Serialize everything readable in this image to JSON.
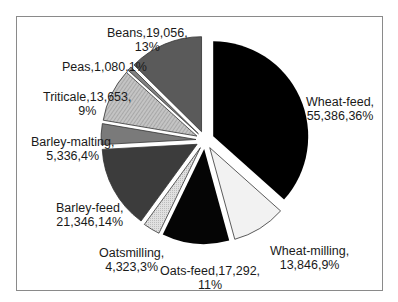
{
  "chart_data": {
    "type": "pie",
    "title": "",
    "start_angle_deg": 0,
    "direction": "clockwise",
    "exploded": true,
    "slices": [
      {
        "label": "Wheat-feed",
        "value": 55386,
        "percent": 36,
        "text_line1": "Wheat-feed,",
        "text_line2": "55,386,36%",
        "fill": "#000000",
        "pattern": "solid"
      },
      {
        "label": "Wheat-milling",
        "value": 13846,
        "percent": 9,
        "text_line1": "Wheat-milling,",
        "text_line2": "13,846,9%",
        "fill": "#f2f2f2",
        "pattern": "solid"
      },
      {
        "label": "Oats-feed",
        "value": 17292,
        "percent": 11,
        "text_line1": "Oats-feed,17,292,",
        "text_line2": "11%",
        "fill": "#050505",
        "pattern": "solid"
      },
      {
        "label": "Oatsmilling",
        "value": 4323,
        "percent": 3,
        "text_line1": "Oatsmilling,",
        "text_line2": "4,323,3%",
        "fill": "#d6d6d6",
        "pattern": "dots"
      },
      {
        "label": "Barley-feed",
        "value": 21346,
        "percent": 14,
        "text_line1": "Barley-feed,",
        "text_line2": "21,346,14%",
        "fill": "#3c3c3c",
        "pattern": "solid"
      },
      {
        "label": "Barley-malting",
        "value": 5336,
        "percent": 4,
        "text_line1": "Barley-malting,",
        "text_line2": "5,336,4%",
        "fill": "#7a7a7a",
        "pattern": "solid"
      },
      {
        "label": "Triticale",
        "value": 13653,
        "percent": 9,
        "text_line1": "Triticale,13,653,",
        "text_line2": "9%",
        "fill": "#b4b4b4",
        "pattern": "hatch"
      },
      {
        "label": "Peas",
        "value": 1080,
        "percent": 1,
        "text_line1": "Peas,1,080,1%",
        "text_line2": "",
        "fill": "#808080",
        "pattern": "solid"
      },
      {
        "label": "Beans",
        "value": 19056,
        "percent": 13,
        "text_line1": "Beans,19,056,",
        "text_line2": "13%",
        "fill": "#5a5a5a",
        "pattern": "solid"
      }
    ]
  },
  "layout": {
    "center": [
      205,
      140
    ],
    "radius": 95,
    "explode": 9
  },
  "labels": {
    "wheat_feed": {
      "l1": "Wheat-feed,",
      "l2": "55,386,36%"
    },
    "wheat_milling": {
      "l1": "Wheat-milling,",
      "l2": "13,846,9%"
    },
    "oats_feed": {
      "l1": "Oats-feed,17,292,",
      "l2": "11%"
    },
    "oatsmilling": {
      "l1": "Oatsmilling,",
      "l2": "4,323,3%"
    },
    "barley_feed": {
      "l1": "Barley-feed,",
      "l2": "21,346,14%"
    },
    "barley_malting": {
      "l1": "Barley-malting,",
      "l2": "5,336,4%"
    },
    "triticale": {
      "l1": "Triticale,13,653,",
      "l2": "9%"
    },
    "peas": {
      "l1": "Peas,1,080,1%"
    },
    "beans": {
      "l1": "Beans,19,056,",
      "l2": "13%"
    }
  }
}
